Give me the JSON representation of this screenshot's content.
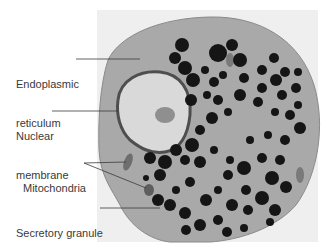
{
  "figure": {
    "type": "electron-micrograph",
    "colors": {
      "background": "#ffffff",
      "photo_bg": "#efefef",
      "cytoplasm": "#a9a9a9",
      "nucleus": "#d9d9d9",
      "granule": "#151515",
      "mitochondria": "#6e6e6e",
      "label_text": "#3a3a3a",
      "leader_line": "#3a3a3a"
    }
  },
  "labels": [
    {
      "id": "er",
      "line1": "Endoplasmic",
      "line2": "reticulum"
    },
    {
      "id": "nm",
      "line1": "Nuclear",
      "line2": "membrane"
    },
    {
      "id": "mito",
      "line1": "Mitochondria",
      "line2": ""
    },
    {
      "id": "sg",
      "line1": "Secretory granule",
      "line2": ""
    }
  ]
}
